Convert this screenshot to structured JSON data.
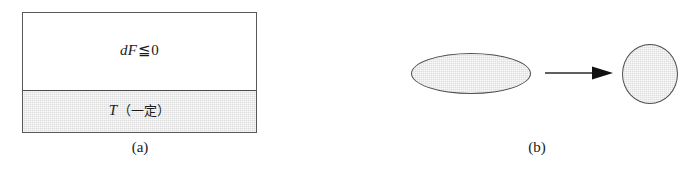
{
  "figure": {
    "background_color": "#ffffff",
    "line_color": "#4f4f4f",
    "fill_color": "#dedede"
  },
  "panel_a": {
    "caption": "(a)",
    "upper_region": {
      "label_prefix": "dF",
      "relation_symbol": "≦",
      "label_value": "0",
      "full_text": "dF≦0",
      "fill": "white"
    },
    "lower_region": {
      "label_variable": "T",
      "label_annotation": "（一定）",
      "full_text": "T（一定）",
      "fill": "#dedede"
    }
  },
  "panel_b": {
    "caption": "(b)",
    "shape_before": "flat-ellipse",
    "shape_after": "round-ellipse",
    "arrow": "rightwards-arrow"
  }
}
